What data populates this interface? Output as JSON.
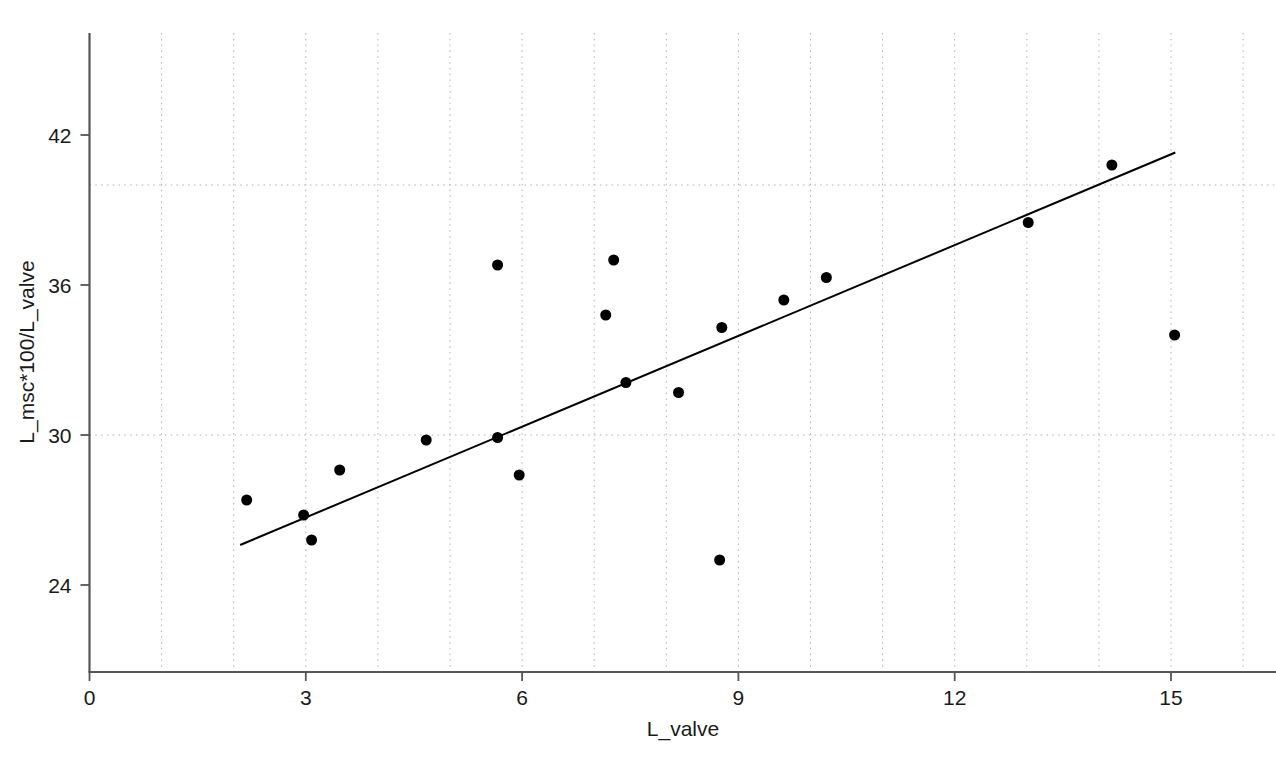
{
  "chart_data": {
    "type": "scatter",
    "title": "",
    "xlabel": "L_valve",
    "ylabel": "L_msc*100/L_valve",
    "xlim": [
      0,
      16.4
    ],
    "ylim": [
      20.2,
      44.4
    ],
    "xticks": [
      0,
      3,
      6,
      9,
      12,
      15
    ],
    "xtick_labels": [
      "0",
      "3",
      "6",
      "9",
      "12",
      "15"
    ],
    "yticks": [
      24,
      30,
      36,
      42
    ],
    "ytick_labels": [
      "24",
      "30",
      "36",
      "42"
    ],
    "grid": {
      "visible": true,
      "style": "dotted",
      "color": "#b4b4b4",
      "x_gridlines": [
        1,
        2,
        3,
        4,
        5,
        6,
        7,
        8,
        9,
        10,
        11,
        12,
        13,
        14,
        15,
        16
      ],
      "y_gridlines": [
        30,
        40
      ]
    },
    "legend": {
      "visible": false,
      "position": "none"
    },
    "marker": {
      "shape": "circle",
      "color": "#000000",
      "size": 11
    },
    "points": [
      {
        "x": 2.18,
        "y": 27.4
      },
      {
        "x": 2.97,
        "y": 26.8
      },
      {
        "x": 3.08,
        "y": 25.8
      },
      {
        "x": 3.47,
        "y": 28.6
      },
      {
        "x": 4.67,
        "y": 29.8
      },
      {
        "x": 5.66,
        "y": 36.8
      },
      {
        "x": 5.66,
        "y": 29.9
      },
      {
        "x": 5.96,
        "y": 28.4
      },
      {
        "x": 7.16,
        "y": 34.8
      },
      {
        "x": 7.27,
        "y": 37.0
      },
      {
        "x": 7.44,
        "y": 32.1
      },
      {
        "x": 8.17,
        "y": 31.7
      },
      {
        "x": 8.74,
        "y": 25.0
      },
      {
        "x": 8.77,
        "y": 34.3
      },
      {
        "x": 9.63,
        "y": 35.4
      },
      {
        "x": 10.22,
        "y": 36.3
      },
      {
        "x": 13.02,
        "y": 38.5
      },
      {
        "x": 14.18,
        "y": 40.8
      },
      {
        "x": 15.05,
        "y": 34.0
      }
    ],
    "fit_line": {
      "type": "linear-regression",
      "color": "#000000",
      "x_start": 2.09,
      "y_start": 25.6,
      "x_end": 15.06,
      "y_end": 41.3
    },
    "axis_color": "#555555",
    "text_color": "#1a1a1a"
  }
}
